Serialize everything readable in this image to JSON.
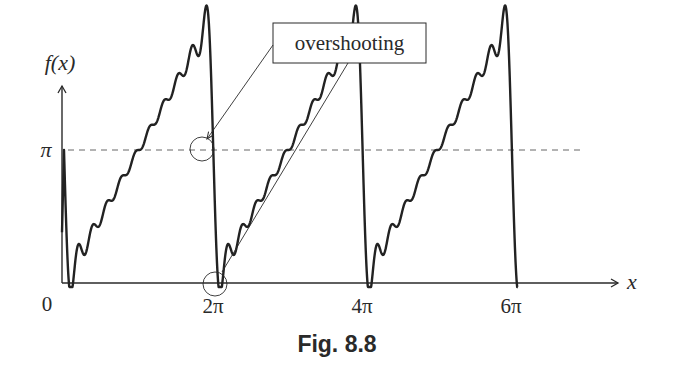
{
  "figure": {
    "caption": "Fig. 8.8",
    "annotation_label": "overshooting",
    "y_axis_label": "f(x)",
    "x_axis_label": "x",
    "y_tick_pi": "π",
    "origin_label": "0",
    "x_ticks": [
      "2π",
      "4π",
      "6π"
    ]
  },
  "chart_data": {
    "type": "line",
    "title": "Fig. 8.8",
    "xlabel": "x",
    "ylabel": "f(x)",
    "x_ticks": [
      {
        "label": "0",
        "value": 0
      },
      {
        "label": "2π",
        "value": 6.2832
      },
      {
        "label": "4π",
        "value": 12.5664
      },
      {
        "label": "6π",
        "value": 18.8496
      }
    ],
    "y_ticks": [
      {
        "label": "π",
        "value": 3.1416
      }
    ],
    "reference_lines": [
      {
        "type": "horizontal",
        "value": 3.1416,
        "style": "dashed"
      }
    ],
    "series": [
      {
        "name": "partial Fourier sum",
        "function": "pi - 2*sum_{n=1..N} sin(n x)/n",
        "terms": 10,
        "x_range": [
          0,
          19.1
        ]
      }
    ],
    "annotations": [
      {
        "text": "overshooting",
        "points_to": [
          {
            "x": 6.2,
            "y": 3.6
          },
          {
            "x": 6.3,
            "y": 0.0
          }
        ]
      }
    ],
    "xlim": [
      0,
      21.5
    ],
    "ylim": [
      0,
      4.8
    ],
    "grid": false
  }
}
